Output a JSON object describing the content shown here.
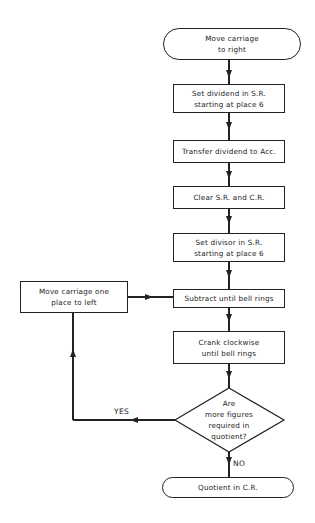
{
  "flowchart": {
    "start": {
      "line1": "Move carriage",
      "line2": "to right"
    },
    "steps": [
      {
        "line1": "Set dividend in S.R.",
        "line2": "starting at place 6"
      },
      {
        "line1": "Transfer dividend to Acc."
      },
      {
        "line1": "Clear S.R. and C.R."
      },
      {
        "line1": "Set divisor in S.R.",
        "line2": "starting at place 6"
      },
      {
        "line1": "Subtract until bell rings"
      },
      {
        "line1": "Crank clockwise",
        "line2": "until bell rings"
      }
    ],
    "loop_step": {
      "line1": "Move carriage one",
      "line2": "place to left"
    },
    "decision": {
      "line1": "Are",
      "line2": "more figures",
      "line3": "required in",
      "line4": "quotient?"
    },
    "yes_label": "YES",
    "no_label": "NO",
    "end": {
      "line1": "Quotient in C.R."
    }
  },
  "colors": {
    "stroke": "#222222",
    "background": "#ffffff"
  }
}
